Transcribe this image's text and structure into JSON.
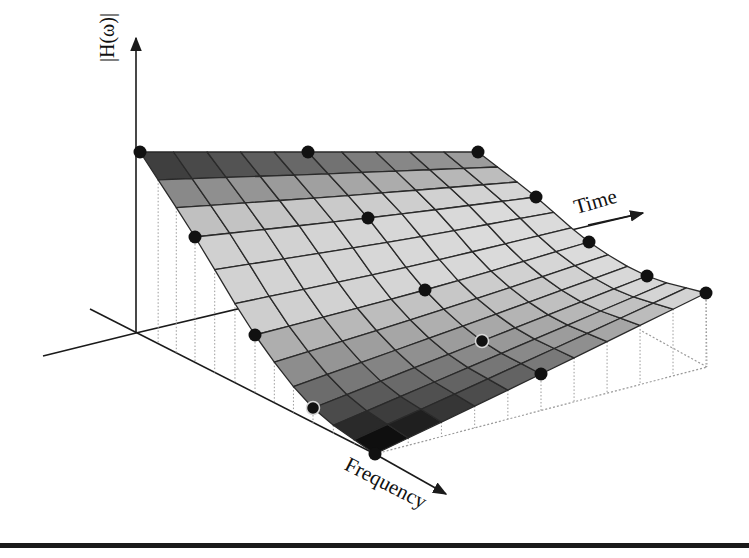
{
  "figure": {
    "title": "",
    "labels": {
      "vertical_axis": "|H(ω)|",
      "time_axis": "Time",
      "frequency_axis": "Frequency"
    },
    "colors": {
      "axis": "#1a1a1a",
      "grid_line": "#2a2a2a",
      "dot": "#111111",
      "dot_ring": "#d8d8d8",
      "dotted": "#9a9a9a",
      "dark": "#141414",
      "light": "#d4d4d4"
    }
  },
  "chart_data": {
    "type": "surface",
    "title": "",
    "xlabel": "Time",
    "ylabel": "Frequency",
    "zlabel": "|H(ω)|",
    "grid": {
      "time_cells": 10,
      "frequency_cells": 12
    },
    "control_points": [
      {
        "time": 0.0,
        "freq": 0.0,
        "x": 140,
        "y": 152
      },
      {
        "time": 0.5,
        "freq": 0.0,
        "x": 308,
        "y": 152
      },
      {
        "time": 1.0,
        "freq": 0.0,
        "x": 478,
        "y": 152
      },
      {
        "time": 0.0,
        "freq": 0.25,
        "x": 195,
        "y": 237
      },
      {
        "time": 0.5,
        "freq": 0.25,
        "x": 368,
        "y": 218
      },
      {
        "time": 1.0,
        "freq": 0.25,
        "x": 536,
        "y": 197
      },
      {
        "time": 1.0,
        "freq": 0.5,
        "x": 589,
        "y": 242
      },
      {
        "time": 0.0,
        "freq": 0.5,
        "x": 255,
        "y": 335
      },
      {
        "time": 0.5,
        "freq": 0.5,
        "x": 425,
        "y": 290
      },
      {
        "time": 1.0,
        "freq": 0.75,
        "x": 647,
        "y": 276
      },
      {
        "time": 0.0,
        "freq": 0.75,
        "x": 313,
        "y": 408
      },
      {
        "time": 0.5,
        "freq": 0.75,
        "x": 482,
        "y": 341
      },
      {
        "time": 0.0,
        "freq": 1.0,
        "x": 375,
        "y": 454
      },
      {
        "time": 0.5,
        "freq": 1.0,
        "x": 541,
        "y": 374
      },
      {
        "time": 1.0,
        "freq": 1.0,
        "x": 706,
        "y": 293
      }
    ],
    "ringed_points": [
      [
        313,
        408
      ],
      [
        482,
        341
      ]
    ],
    "base_plane": {
      "origin": [
        136,
        333
      ],
      "front": [
        375,
        454
      ],
      "right": [
        707,
        367
      ]
    },
    "axes": {
      "vertical": {
        "from": [
          136,
          333
        ],
        "to": [
          136,
          38
        ]
      },
      "time": {
        "from": [
          136,
          333
        ],
        "to": [
          643,
          213
        ]
      },
      "frequency": {
        "from": [
          90,
          309
        ],
        "to": [
          446,
          494
        ]
      },
      "left_stub": {
        "from": [
          136,
          333
        ],
        "to": [
          43,
          356
        ]
      }
    }
  }
}
